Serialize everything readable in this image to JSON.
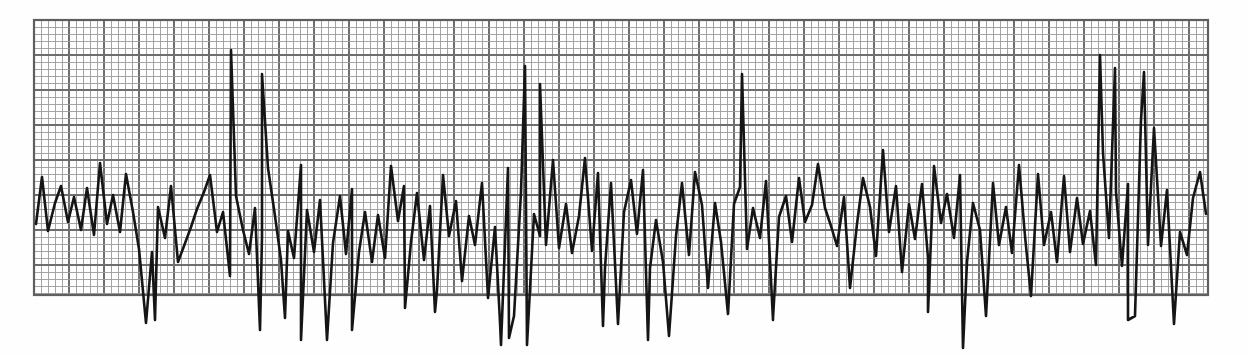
{
  "document": {
    "kind": "strip-chart-recording",
    "media": "graph-paper",
    "title": "",
    "caption": ""
  },
  "colors": {
    "paper": "#fefefe",
    "grid_minor": "#9b9b9b",
    "grid_major": "#6e6e6e",
    "grid_border": "#5f5f5f",
    "trace": "#151515"
  },
  "grid": {
    "x": 34,
    "y": 20,
    "width": 1174,
    "height": 275,
    "minor_step": 7,
    "major_every": 5,
    "minor_width": 0.9,
    "major_width": 1.9,
    "border_width": 2.2,
    "show_border": true
  },
  "chart_data": {
    "type": "line",
    "title": "",
    "subtitle": "",
    "xlabel": "",
    "ylabel": "",
    "xlim": [
      0,
      1174
    ],
    "ylim": [
      0,
      356
    ],
    "grid": true,
    "legend": null,
    "annotations": [],
    "series": [
      {
        "name": "recording-trace",
        "color": "#151515",
        "stroke_width": 2.6,
        "x": [
          36,
          42,
          48,
          55,
          61,
          68,
          74,
          81,
          87,
          94,
          100,
          107,
          113,
          120,
          126,
          133,
          139,
          146,
          152,
          158,
          165,
          171,
          178,
          184,
          191,
          197,
          204,
          210,
          217,
          223,
          230,
          236,
          243,
          249,
          255,
          262,
          268,
          275,
          281,
          288,
          294,
          301,
          307,
          314,
          320,
          327,
          333,
          340,
          346,
          352,
          359,
          365,
          372,
          378,
          385,
          391,
          398,
          404,
          411,
          417,
          424,
          430,
          437,
          443,
          449,
          456,
          462,
          469,
          475,
          482,
          488,
          495,
          501,
          508,
          514,
          521,
          527,
          534,
          540,
          546,
          553,
          559,
          566,
          572,
          579,
          585,
          592,
          598,
          605,
          611,
          618,
          624,
          631,
          637,
          643,
          650,
          656,
          663,
          669,
          676,
          682,
          689,
          695,
          702,
          708,
          715,
          721,
          728,
          734,
          740,
          747,
          753,
          760,
          766,
          773,
          779,
          786,
          792,
          799,
          805,
          812,
          818,
          825,
          831,
          837,
          844,
          850,
          857,
          863,
          870,
          876,
          883,
          889,
          896,
          902,
          909,
          915,
          922,
          928,
          934,
          941,
          947,
          954,
          960,
          967,
          973,
          980,
          986,
          993,
          999,
          1006,
          1012,
          1019,
          1025,
          1031,
          1038,
          1044,
          1051,
          1057,
          1064,
          1070,
          1077,
          1083,
          1090,
          1096,
          1103,
          1109,
          1116,
          1122,
          1128,
          1135,
          1141,
          1148,
          1154,
          1161,
          1167,
          1174,
          1180,
          1187,
          1193,
          1200,
          1206
        ],
        "y": [
          224,
          177,
          231,
          203,
          186,
          222,
          197,
          230,
          188,
          235,
          163,
          224,
          195,
          232,
          174,
          212,
          249,
          323,
          252,
          207,
          238,
          186,
          262,
          246,
          227,
          209,
          192,
          175,
          232,
          212,
          276,
          196,
          230,
          254,
          208,
          237,
          168,
          216,
          260,
          231,
          258,
          165,
          210,
          252,
          200,
          340,
          243,
          196,
          254,
          189,
          252,
          212,
          262,
          215,
          258,
          166,
          221,
          186,
          242,
          193,
          260,
          206,
          290,
          175,
          236,
          201,
          281,
          216,
          245,
          183,
          298,
          227,
          345,
          168,
          316,
          192,
          345,
          214,
          236,
          245,
          160,
          248,
          204,
          253,
          216,
          158,
          251,
          173,
          268,
          183,
          324,
          212,
          180,
          234,
          170,
          268,
          220,
          262,
          336,
          236,
          183,
          255,
          172,
          205,
          288,
          203,
          242,
          314,
          204,
          187,
          249,
          208,
          238,
          181,
          320,
          217,
          196,
          242,
          178,
          222,
          205,
          164,
          208,
          226,
          246,
          197,
          288,
          224,
          178,
          207,
          256,
          150,
          232,
          186,
          272,
          204,
          239,
          184,
          258,
          166,
          223,
          194,
          238,
          175,
          262,
          203,
          230,
          316,
          183,
          245,
          207,
          253,
          165,
          236,
          296,
          174,
          245,
          212,
          262,
          176,
          252,
          198,
          244,
          211,
          265,
          153,
          238,
          192,
          266,
          184,
          316,
          120,
          245,
          128,
          246,
          190,
          324,
          232,
          255,
          198,
          172,
          214
        ]
      }
    ],
    "spikes_downward": [
      {
        "x": 155,
        "depth": 320
      },
      {
        "x": 260,
        "depth": 330
      },
      {
        "x": 285,
        "depth": 318
      },
      {
        "x": 301,
        "depth": 340
      },
      {
        "x": 352,
        "depth": 330
      },
      {
        "x": 405,
        "depth": 308
      },
      {
        "x": 435,
        "depth": 312
      },
      {
        "x": 500,
        "depth": 322
      },
      {
        "x": 509,
        "depth": 338
      },
      {
        "x": 603,
        "depth": 326
      },
      {
        "x": 648,
        "depth": 340
      },
      {
        "x": 773,
        "depth": 318
      },
      {
        "x": 928,
        "depth": 312
      },
      {
        "x": 963,
        "depth": 348
      },
      {
        "x": 1128,
        "depth": 320
      }
    ],
    "spikes_upward": [
      {
        "x": 231,
        "peak": 50
      },
      {
        "x": 262,
        "peak": 74
      },
      {
        "x": 525,
        "peak": 66
      },
      {
        "x": 540,
        "peak": 84
      },
      {
        "x": 742,
        "peak": 74
      },
      {
        "x": 1100,
        "peak": 55
      },
      {
        "x": 1115,
        "peak": 68
      },
      {
        "x": 1144,
        "peak": 72
      }
    ]
  }
}
